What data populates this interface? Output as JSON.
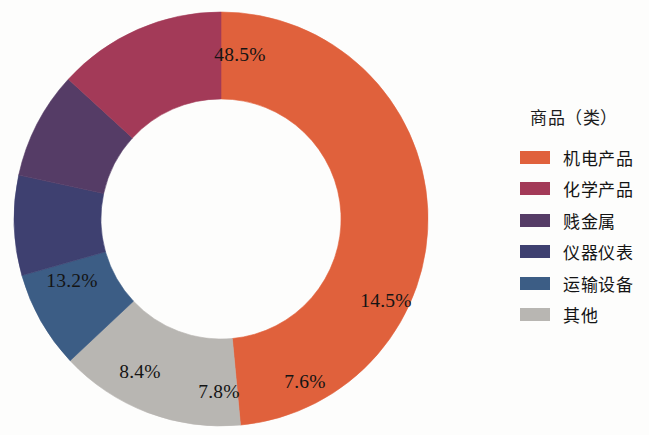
{
  "chart_data": {
    "type": "pie",
    "variant": "donut",
    "title": "",
    "legend_title": "商品（类）",
    "legend_position": "right",
    "start_angle_deg": -90,
    "direction": "clockwise",
    "inner_radius_ratio": 0.58,
    "categories": [
      "机电产品",
      "化学产品",
      "贱金属",
      "仪器仪表",
      "运输设备",
      "其他"
    ],
    "values": [
      48.5,
      13.2,
      8.4,
      7.8,
      7.6,
      14.5
    ],
    "value_labels": [
      "48.5%",
      "13.2%",
      "8.4%",
      "7.8%",
      "7.6%",
      "14.5%"
    ],
    "colors": [
      "#E0613C",
      "#A33A58",
      "#553C66",
      "#3E4070",
      "#3C5D85",
      "#B8B6B2"
    ],
    "units": "percent",
    "total": 100.0,
    "slices": [
      {
        "name": "机电产品",
        "value": 48.5,
        "label": "48.5%",
        "color": "#E0613C",
        "label_x": 234,
        "label_y": 53
      },
      {
        "name": "其他",
        "value": 14.5,
        "label": "14.5%",
        "color": "#B8B6B2",
        "label_x": 380,
        "label_y": 299
      },
      {
        "name": "运输设备",
        "value": 7.6,
        "label": "7.6%",
        "color": "#3C5D85",
        "label_x": 299,
        "label_y": 380
      },
      {
        "name": "仪器仪表",
        "value": 7.8,
        "label": "7.8%",
        "color": "#3E4070",
        "label_x": 213,
        "label_y": 390
      },
      {
        "name": "贱金属",
        "value": 8.4,
        "label": "8.4%",
        "color": "#553C66",
        "label_x": 134,
        "label_y": 370
      },
      {
        "name": "化学产品",
        "value": 13.2,
        "label": "13.2%",
        "color": "#A33A58",
        "label_x": 66,
        "label_y": 279
      }
    ]
  },
  "legend": {
    "title": "商品（类）",
    "items": [
      {
        "label": "机电产品",
        "color": "#E0613C"
      },
      {
        "label": "化学产品",
        "color": "#A33A58"
      },
      {
        "label": "贱金属",
        "color": "#553C66"
      },
      {
        "label": "仪器仪表",
        "color": "#3E4070"
      },
      {
        "label": "运输设备",
        "color": "#3C5D85"
      },
      {
        "label": "其他",
        "color": "#B8B6B2"
      }
    ]
  }
}
